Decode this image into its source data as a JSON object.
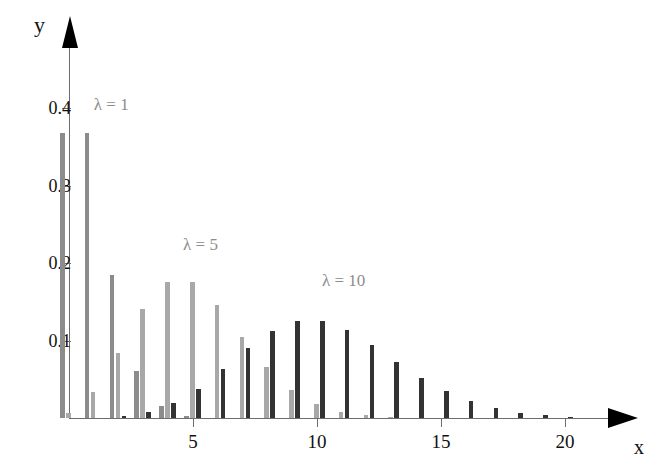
{
  "chart_data": {
    "type": "bar",
    "title": "",
    "subtitle": "",
    "xlabel": "x",
    "ylabel": "y",
    "xlim": [
      0,
      22.5
    ],
    "ylim": [
      0,
      0.45
    ],
    "grid": false,
    "legend_position": "inline-annotations",
    "x_ticks": [
      5,
      10,
      15,
      20
    ],
    "x_tick_labels": [
      "5",
      "10",
      "15",
      "20"
    ],
    "y_ticks": [
      0.1,
      0.2,
      0.3,
      0.4
    ],
    "y_tick_labels": [
      "0.1",
      "0.2",
      "0.3",
      "0.4"
    ],
    "x": [
      0,
      1,
      2,
      3,
      4,
      5,
      6,
      7,
      8,
      9,
      10,
      11,
      12,
      13,
      14,
      15,
      16,
      17,
      18,
      19,
      20,
      21,
      22
    ],
    "series": [
      {
        "name": "lambda = 1",
        "label": "λ = 1",
        "color": "#8c8c8c",
        "values": [
          0.368,
          0.368,
          0.184,
          0.061,
          0.015,
          0.003,
          0.0005,
          0.0001,
          0.0,
          0.0,
          0.0,
          0.0,
          0.0,
          0.0,
          0.0,
          0.0,
          0.0,
          0.0,
          0.0,
          0.0,
          0.0,
          0.0,
          0.0
        ]
      },
      {
        "name": "lambda = 5",
        "label": "λ = 5",
        "color": "#a8a8a8",
        "values": [
          0.0067,
          0.0337,
          0.0842,
          0.1404,
          0.1755,
          0.1755,
          0.1462,
          0.1044,
          0.0653,
          0.0363,
          0.0181,
          0.0082,
          0.0034,
          0.0013,
          0.0005,
          0.0002,
          5e-05,
          1e-05,
          0.0,
          0.0,
          0.0,
          0.0,
          0.0
        ]
      },
      {
        "name": "lambda = 10",
        "label": "λ = 10",
        "color": "#333333",
        "values": [
          5e-05,
          0.0005,
          0.0023,
          0.0076,
          0.0189,
          0.0378,
          0.0631,
          0.0901,
          0.1126,
          0.1251,
          0.1251,
          0.1137,
          0.0948,
          0.0729,
          0.0521,
          0.0347,
          0.0217,
          0.0128,
          0.0071,
          0.0037,
          0.0019,
          0.0009,
          0.0004
        ]
      }
    ],
    "annotations": [
      {
        "text": "λ = 1",
        "x": 1.0,
        "y": 0.415
      },
      {
        "text": "λ = 5",
        "x": 4.6,
        "y": 0.235
      },
      {
        "text": "λ = 10",
        "x": 10.2,
        "y": 0.188
      }
    ]
  },
  "axes": {
    "y_title": "y",
    "x_title": "x"
  }
}
